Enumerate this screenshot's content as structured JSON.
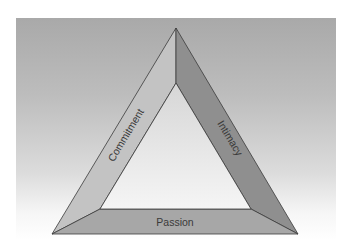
{
  "diagram": {
    "type": "triangle",
    "title": "",
    "sides": [
      {
        "id": "left",
        "label": "Commitment",
        "color": "#c2c2c2"
      },
      {
        "id": "right",
        "label": "Intimacy",
        "color": "#8e8e8e"
      },
      {
        "id": "bottom",
        "label": "Passion",
        "color": "#a6a6a6"
      }
    ],
    "inner_fill_top": "#d9d9d9",
    "inner_fill_bottom": "#f4f4f4",
    "edge_color": "#3a3a3a"
  },
  "labels": {
    "commitment": "Commitment",
    "intimacy": "Intimacy",
    "passion": "Passion"
  }
}
